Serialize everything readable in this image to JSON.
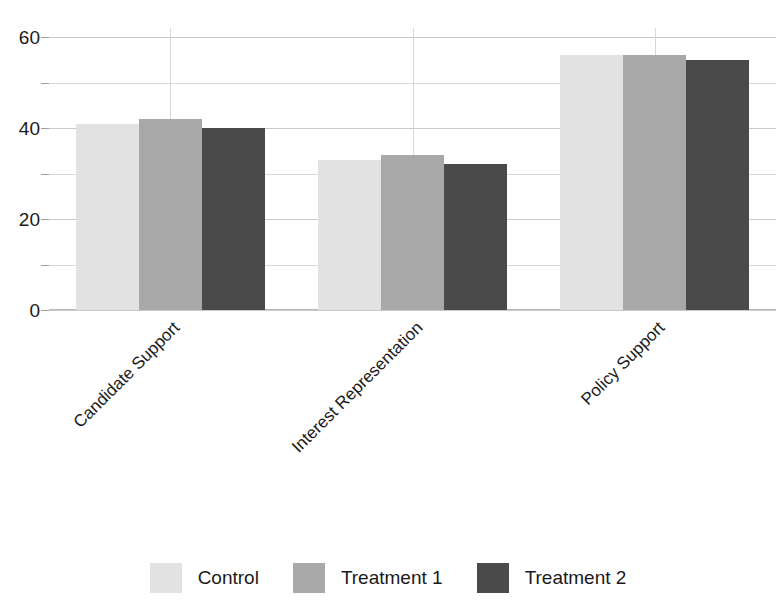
{
  "chart_data": {
    "type": "bar",
    "title": "",
    "subtitle": "",
    "xlabel": "",
    "ylabel": "",
    "categories": [
      "Candidate Support",
      "Interest Representation",
      "Policy Support"
    ],
    "series": [
      {
        "name": "Control",
        "values": [
          41,
          33,
          56
        ],
        "color": "#e2e2e2"
      },
      {
        "name": "Treatment 1",
        "values": [
          42,
          34,
          56
        ],
        "color": "#a8a8a8"
      },
      {
        "name": "Treatment 2",
        "values": [
          40,
          32,
          55
        ],
        "color": "#4a4a4a"
      }
    ],
    "ylim": [
      0,
      62
    ],
    "y_ticks": [
      0,
      20,
      40,
      60
    ],
    "y_tick_labels": [
      "0",
      "20",
      "40",
      "60"
    ],
    "y_minor_gridlines": [
      10,
      30,
      50
    ],
    "grid": true,
    "grid_axis": "both",
    "legend_position": "bottom",
    "x_tick_rotation": -45,
    "bar_group_padding": 0.22
  },
  "axis": {
    "y_labels": [
      "60",
      "40",
      "20",
      "0"
    ]
  },
  "legend": {
    "items": [
      {
        "label": "Control"
      },
      {
        "label": "Treatment 1"
      },
      {
        "label": "Treatment 2"
      }
    ]
  }
}
